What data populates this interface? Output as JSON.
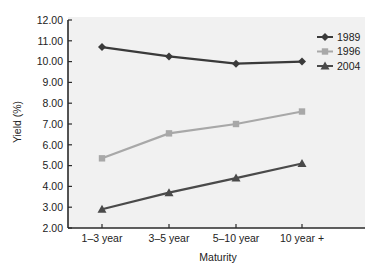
{
  "chart_data": {
    "type": "line",
    "title": "",
    "xlabel": "Maturity",
    "ylabel": "Yield (%)",
    "categories": [
      "1–3 year",
      "3–5 year",
      "5–10 year",
      "10 year +"
    ],
    "ylim": [
      2.0,
      12.0
    ],
    "yticks": [
      "2.00",
      "3.00",
      "4.00",
      "5.00",
      "6.00",
      "7.00",
      "8.00",
      "9.00",
      "10.00",
      "11.00",
      "12.00"
    ],
    "grid": false,
    "legend_position": "top-right",
    "series": [
      {
        "name": "1989",
        "values": [
          10.7,
          10.25,
          9.9,
          10.0
        ],
        "color": "#3a3a3a",
        "marker": "diamond"
      },
      {
        "name": "1996",
        "values": [
          5.35,
          6.55,
          7.0,
          7.6
        ],
        "color": "#a8a8a8",
        "marker": "square"
      },
      {
        "name": "2004",
        "values": [
          2.9,
          3.7,
          4.4,
          5.1
        ],
        "color": "#4a4a4a",
        "marker": "triangle"
      }
    ]
  },
  "colors": {
    "plot_background": "#f1f1f1",
    "axis": "#2a2a2a"
  }
}
